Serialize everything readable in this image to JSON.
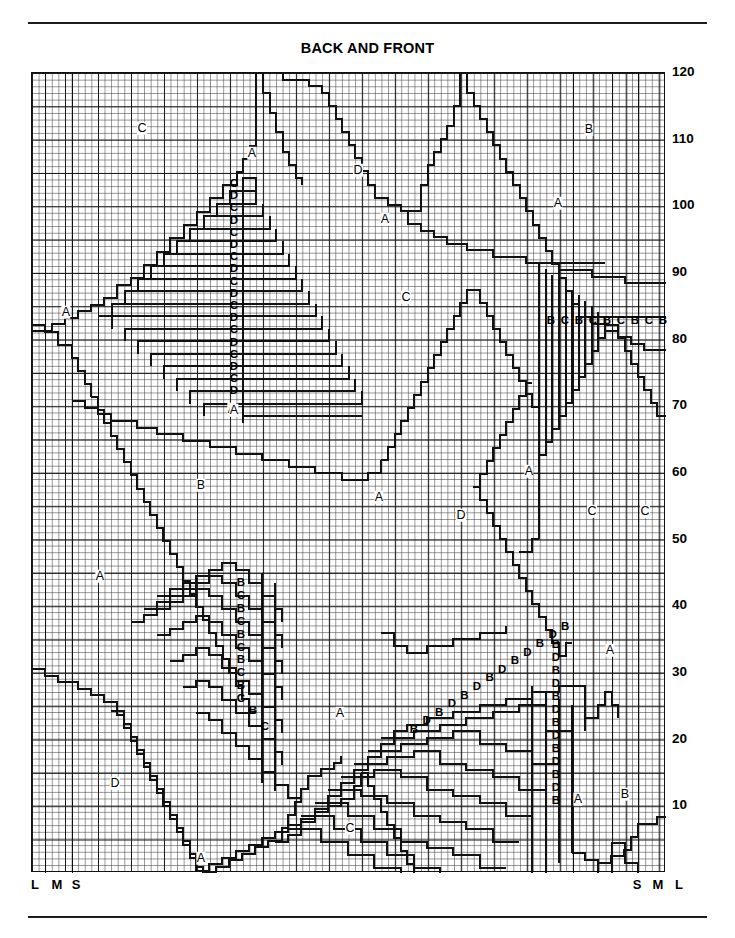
{
  "chart_title": "BACK AND FRONT",
  "rules": {
    "top": "horizontal-rule",
    "bottom": "horizontal-rule"
  },
  "axis": {
    "side": "right",
    "unit": "rows",
    "ticks": [
      120,
      110,
      100,
      90,
      80,
      70,
      60,
      50,
      40,
      30,
      20,
      10
    ],
    "min": 0,
    "max": 120
  },
  "size_labels": {
    "left": [
      "L",
      "M",
      "S"
    ],
    "right": [
      "S",
      "M",
      "L"
    ]
  },
  "chart_data": {
    "type": "heatmap",
    "title": "BACK AND FRONT",
    "xlabel": "",
    "ylabel": "rows",
    "ylim": [
      0,
      120
    ],
    "grid": true,
    "columns": 96,
    "rows": 120,
    "legend_position": "none",
    "categories": [
      "A",
      "B",
      "C",
      "D"
    ],
    "region_letters": [
      {
        "label": "C",
        "x": 142,
        "y": 128
      },
      {
        "label": "A",
        "x": 252,
        "y": 153
      },
      {
        "label": "D",
        "x": 358,
        "y": 170
      },
      {
        "label": "B",
        "x": 589,
        "y": 129
      },
      {
        "label": "A",
        "x": 385,
        "y": 219
      },
      {
        "label": "A",
        "x": 558,
        "y": 203
      },
      {
        "label": "A",
        "x": 66,
        "y": 312
      },
      {
        "label": "C",
        "x": 406,
        "y": 297
      },
      {
        "label": "A",
        "x": 232,
        "y": 409
      },
      {
        "label": "B",
        "x": 201,
        "y": 485
      },
      {
        "label": "A",
        "x": 379,
        "y": 497
      },
      {
        "label": "D",
        "x": 461,
        "y": 515
      },
      {
        "label": "A",
        "x": 529,
        "y": 471
      },
      {
        "label": "C",
        "x": 592,
        "y": 511
      },
      {
        "label": "C",
        "x": 645,
        "y": 511
      },
      {
        "label": "A",
        "x": 100,
        "y": 576
      },
      {
        "label": "A",
        "x": 610,
        "y": 650
      },
      {
        "label": "A",
        "x": 340,
        "y": 713
      },
      {
        "label": "D",
        "x": 115,
        "y": 783
      },
      {
        "label": "A",
        "x": 578,
        "y": 799
      },
      {
        "label": "B",
        "x": 625,
        "y": 794
      },
      {
        "label": "C",
        "x": 350,
        "y": 828
      },
      {
        "label": "A",
        "x": 201,
        "y": 858
      }
    ],
    "stack_cd": {
      "name": "upper-left-chevron-stack",
      "letters": [
        "C",
        "D",
        "C",
        "D",
        "C",
        "D",
        "C",
        "D",
        "C",
        "D",
        "C",
        "D",
        "C",
        "D",
        "C",
        "D",
        "C",
        "D"
      ],
      "x": 234,
      "y_start": 184,
      "y_step": 12.2,
      "bottom_letter": "A",
      "bottom_letter_x": 234,
      "bottom_letter_y": 410
    },
    "stack_bc_right": {
      "name": "right-vertical-bc-band",
      "letters": [
        "B",
        "C",
        "B",
        "C",
        "B",
        "C",
        "B",
        "C",
        "B"
      ],
      "x_start": 551,
      "x_step": 14.0,
      "y": 321
    },
    "stack_bc_lower": {
      "name": "lower-left-diagonal-bc-stack",
      "letters": [
        "B",
        "C",
        "B",
        "C",
        "B",
        "C",
        "B",
        "C",
        "B",
        "C"
      ],
      "x": 241,
      "y_start": 583,
      "y_step": 12.9,
      "tail": [
        {
          "label": "B",
          "x": 253,
          "y": 711
        },
        {
          "label": "C",
          "x": 265,
          "y": 727
        }
      ]
    },
    "stack_bd_lower_diag": {
      "name": "lower-right-diagonal-bd-stack",
      "letters": [
        "B",
        "D",
        "B",
        "D",
        "B",
        "D",
        "B",
        "D",
        "B",
        "D",
        "B",
        "D",
        "B"
      ],
      "x_start": 414,
      "x_step": 12.6,
      "y_start": 730,
      "y_step": -8.6
    },
    "stack_bd_column": {
      "name": "lower-right-vertical-bd-column",
      "letters": [
        "B",
        "D",
        "B",
        "D",
        "B",
        "D",
        "B",
        "D",
        "B",
        "D",
        "B",
        "D",
        "B"
      ],
      "x": 556,
      "y_start": 645,
      "y_step": 13.0
    }
  }
}
